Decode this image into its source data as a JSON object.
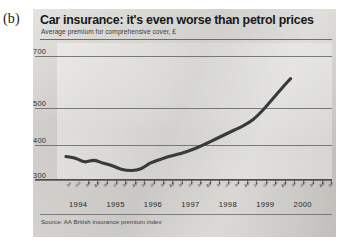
{
  "figure_label": "(b)",
  "source_note": "Source: AA British insurance premium index",
  "colors": {
    "panel_background": "#cfcdc8",
    "line": "#3a3a3c",
    "gridline": "#5c5b60",
    "text": "#18181a"
  },
  "chart_data": {
    "type": "line",
    "title": "Car insurance: it's even worse than petrol prices",
    "subtitle": "Average premium for comprehensive cover, £",
    "xlabel": "",
    "ylabel": "",
    "ylim": [
      300,
      760
    ],
    "yticks": [
      300,
      400,
      500,
      700
    ],
    "ytick_labels": [
      "300",
      "400",
      "500",
      "700"
    ],
    "grid": true,
    "legend": "none",
    "xlim": [
      "1994-07",
      "2000-07"
    ],
    "year_labels": [
      "1994",
      "1995",
      "1996",
      "1997",
      "1998",
      "1999",
      "2000"
    ],
    "xtick_labels": [
      "Jul",
      "Oct",
      "Jan",
      "Apr",
      "Jul",
      "Oct",
      "Jan",
      "Apr",
      "Jul",
      "Oct",
      "Jan",
      "Apr",
      "Jul",
      "Oct",
      "Jan",
      "Apr",
      "Jul",
      "Oct",
      "Jan",
      "Apr",
      "Jul",
      "Oct",
      "Jan",
      "Apr",
      "Jul",
      "Oct",
      "Jan",
      "Apr",
      "Jul"
    ],
    "series": [
      {
        "name": "Average comprehensive car insurance premium",
        "x": [
          "1994-07",
          "1994-10",
          "1995-01",
          "1995-04",
          "1995-07",
          "1995-10",
          "1996-01",
          "1996-04",
          "1996-07",
          "1996-10",
          "1997-01",
          "1997-04",
          "1997-07",
          "1997-10",
          "1998-01",
          "1998-04",
          "1998-07",
          "1998-10",
          "1999-01",
          "1999-04",
          "1999-07",
          "1999-10",
          "2000-01",
          "2000-04",
          "2000-07"
        ],
        "values": [
          367,
          362,
          352,
          356,
          348,
          340,
          330,
          327,
          332,
          348,
          358,
          367,
          374,
          382,
          392,
          404,
          416,
          428,
          440,
          452,
          468,
          492,
          530,
          572,
          612
        ]
      }
    ]
  }
}
